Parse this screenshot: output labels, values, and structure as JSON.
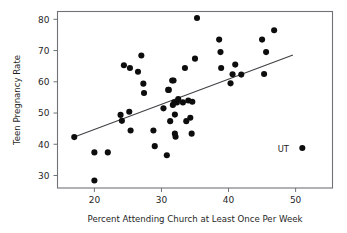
{
  "chart_data": {
    "type": "scatter",
    "title": "",
    "xlabel": "Percent Attending Church at Least Once Per Week",
    "ylabel": "Teen Pregnancy Rate",
    "xlim": [
      14.5,
      55.5
    ],
    "ylim": [
      26.0,
      82.5
    ],
    "xticks": [
      20,
      30,
      40,
      50
    ],
    "yticks": [
      30,
      40,
      50,
      60,
      70,
      80
    ],
    "xtick_labels": [
      "20",
      "30",
      "40",
      "50"
    ],
    "ytick_labels": [
      "30",
      "40",
      "50",
      "60",
      "70",
      "80"
    ],
    "grid": false,
    "legend": "none",
    "marker": "filled-circle",
    "marker_color": "#0d0d0d",
    "trend_line": {
      "label": "least-squares regression line",
      "color": "#3d3f42",
      "x_start": 17.0,
      "y_start": 42.3,
      "x_end": 49.6,
      "y_end": 68.6
    },
    "annotations": [
      {
        "text": "UT",
        "x": 49.0,
        "y": 38.7,
        "point_x": 51.0,
        "point_y": 38.8
      }
    ],
    "points": [
      {
        "x": 17.0,
        "y": 42.3
      },
      {
        "x": 20.0,
        "y": 37.4
      },
      {
        "x": 20.0,
        "y": 28.4
      },
      {
        "x": 22.0,
        "y": 37.4
      },
      {
        "x": 23.9,
        "y": 49.4
      },
      {
        "x": 24.1,
        "y": 47.5
      },
      {
        "x": 24.4,
        "y": 65.3
      },
      {
        "x": 25.2,
        "y": 50.4
      },
      {
        "x": 25.3,
        "y": 64.4
      },
      {
        "x": 25.4,
        "y": 44.4
      },
      {
        "x": 26.5,
        "y": 63.2
      },
      {
        "x": 27.0,
        "y": 68.4
      },
      {
        "x": 27.3,
        "y": 59.4
      },
      {
        "x": 27.4,
        "y": 56.4
      },
      {
        "x": 28.8,
        "y": 44.4
      },
      {
        "x": 29.0,
        "y": 39.4
      },
      {
        "x": 30.3,
        "y": 51.5
      },
      {
        "x": 30.8,
        "y": 36.5
      },
      {
        "x": 31.0,
        "y": 57.4
      },
      {
        "x": 31.1,
        "y": 57.4
      },
      {
        "x": 31.3,
        "y": 47.4
      },
      {
        "x": 31.6,
        "y": 60.4
      },
      {
        "x": 31.7,
        "y": 52.6
      },
      {
        "x": 31.8,
        "y": 60.4
      },
      {
        "x": 31.9,
        "y": 53.4
      },
      {
        "x": 32.0,
        "y": 49.5
      },
      {
        "x": 32.0,
        "y": 43.4
      },
      {
        "x": 32.1,
        "y": 42.4
      },
      {
        "x": 32.3,
        "y": 53.4
      },
      {
        "x": 32.5,
        "y": 54.5
      },
      {
        "x": 33.2,
        "y": 53.4
      },
      {
        "x": 33.5,
        "y": 64.4
      },
      {
        "x": 33.7,
        "y": 47.4
      },
      {
        "x": 34.0,
        "y": 54.0
      },
      {
        "x": 34.3,
        "y": 48.5
      },
      {
        "x": 34.5,
        "y": 43.4
      },
      {
        "x": 34.6,
        "y": 53.6
      },
      {
        "x": 35.0,
        "y": 67.4
      },
      {
        "x": 35.3,
        "y": 80.4
      },
      {
        "x": 38.6,
        "y": 73.5
      },
      {
        "x": 38.8,
        "y": 69.5
      },
      {
        "x": 38.9,
        "y": 64.4
      },
      {
        "x": 40.3,
        "y": 59.5
      },
      {
        "x": 40.6,
        "y": 62.4
      },
      {
        "x": 41.0,
        "y": 65.5
      },
      {
        "x": 41.9,
        "y": 62.3
      },
      {
        "x": 45.0,
        "y": 73.5
      },
      {
        "x": 45.3,
        "y": 62.5
      },
      {
        "x": 45.6,
        "y": 69.5
      },
      {
        "x": 46.8,
        "y": 76.5
      },
      {
        "x": 51.0,
        "y": 38.8
      }
    ]
  }
}
